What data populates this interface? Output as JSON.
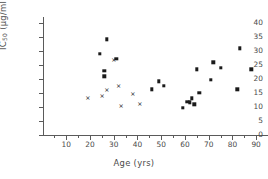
{
  "chart_data": {
    "type": "scatter",
    "title": "",
    "xlabel": "Age (yrs)",
    "ylabel_html": "IC<sub>50</sub> (µg/ml)",
    "ylabel": "IC50 (µg/ml)",
    "xlim": [
      0,
      95
    ],
    "ylim": [
      0,
      42
    ],
    "grid": false,
    "legend": "none",
    "xticks": [
      10,
      20,
      30,
      40,
      50,
      60,
      70,
      80,
      90
    ],
    "xticklabels": [
      "10",
      "20",
      "30",
      "40",
      "50",
      "60",
      "70",
      "80",
      "90"
    ],
    "yticks": [
      0,
      5,
      10,
      15,
      20,
      25,
      30,
      35,
      40
    ],
    "yticklabels": [
      "0",
      "5",
      "10",
      "15",
      "20",
      "25",
      "30",
      "35",
      "40"
    ],
    "series": [
      {
        "name": "filled-circle",
        "marker": "dot",
        "color": "#1a1a1a",
        "points": [
          {
            "x": 27,
            "y": 34.2
          },
          {
            "x": 24,
            "y": 29.0
          },
          {
            "x": 26,
            "y": 23.0
          },
          {
            "x": 26,
            "y": 21.0
          },
          {
            "x": 31,
            "y": 27.2
          },
          {
            "x": 46,
            "y": 16.3
          },
          {
            "x": 49,
            "y": 19.1
          },
          {
            "x": 51,
            "y": 17.6
          },
          {
            "x": 59,
            "y": 9.8
          },
          {
            "x": 61,
            "y": 11.8
          },
          {
            "x": 62,
            "y": 11.7
          },
          {
            "x": 63,
            "y": 13.1
          },
          {
            "x": 64,
            "y": 10.9
          },
          {
            "x": 65,
            "y": 23.5
          },
          {
            "x": 66,
            "y": 15.0
          },
          {
            "x": 71,
            "y": 19.7
          },
          {
            "x": 72,
            "y": 26.0
          },
          {
            "x": 75,
            "y": 23.9
          },
          {
            "x": 82,
            "y": 16.3
          },
          {
            "x": 83,
            "y": 31.0
          },
          {
            "x": 88,
            "y": 23.5
          }
        ]
      },
      {
        "name": "cross",
        "marker": "cross",
        "color": "#1a1a1a",
        "points": [
          {
            "x": 19,
            "y": 13.5
          },
          {
            "x": 25,
            "y": 14.3
          },
          {
            "x": 27,
            "y": 16.5
          },
          {
            "x": 30,
            "y": 27.2
          },
          {
            "x": 32,
            "y": 18.0
          },
          {
            "x": 33,
            "y": 10.6
          },
          {
            "x": 38,
            "y": 14.9
          },
          {
            "x": 41,
            "y": 11.3
          }
        ]
      }
    ]
  }
}
